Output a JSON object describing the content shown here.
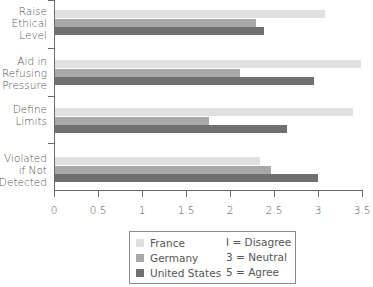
{
  "chart_data": {
    "type": "bar",
    "orientation": "horizontal",
    "title": "",
    "xlabel": "",
    "ylabel": "",
    "xlim": [
      0,
      3.5
    ],
    "xticks": [
      "0",
      "0.5",
      "1",
      "1.5",
      "2",
      "2.5",
      "3",
      "3.5"
    ],
    "categories": [
      "Raise\nEthical\nLevel",
      "Aid in\nRefusing\nPressure",
      "Define\nLimits",
      "Violated\nif Not\nDetected"
    ],
    "series": [
      {
        "name": "France",
        "color": "#e0e0e0",
        "values": [
          3.07,
          3.48,
          3.39,
          2.33
        ]
      },
      {
        "name": "Germany",
        "color": "#a9a9a9",
        "values": [
          2.28,
          2.1,
          1.75,
          2.46
        ]
      },
      {
        "name": "United States",
        "color": "#707070",
        "values": [
          2.37,
          2.94,
          2.64,
          2.99
        ]
      }
    ],
    "legend": {
      "position": "bottom-center",
      "entries": [
        "France",
        "Germany",
        "United States"
      ],
      "notes": [
        "I = Disagree",
        "3 = Neutral",
        "5 = Agree"
      ]
    },
    "grid": false
  }
}
